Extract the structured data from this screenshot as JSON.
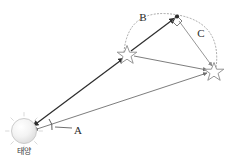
{
  "figure": {
    "background_color": "#ffffff",
    "width": 231,
    "height": 164
  },
  "sun": {
    "caption": "태양",
    "icon": "sun-icon",
    "center": {
      "x": 24,
      "y": 131
    },
    "radius": 12,
    "fill_color": "#efefef",
    "stroke_color": "#bdbdbd"
  },
  "stars": [
    {
      "name": "star-position-left",
      "icon": "star-icon",
      "x": 127,
      "y": 54,
      "size": 9,
      "stroke_color": "#8a8a8a"
    },
    {
      "name": "star-position-right",
      "icon": "star-icon",
      "x": 214,
      "y": 71,
      "size": 9,
      "stroke_color": "#8a8a8a"
    }
  ],
  "apex": {
    "name": "orbit-apex-point",
    "x": 178,
    "y": 17,
    "right_angle_marker": true
  },
  "labels": [
    {
      "name": "label-A",
      "text": "A",
      "x": 78,
      "y": 130,
      "angle_of": "sun-vertex-angle"
    },
    {
      "name": "label-B",
      "text": "B",
      "x": 143,
      "y": 17,
      "angle_of": "left-arc-segment"
    },
    {
      "name": "label-C",
      "text": "C",
      "x": 200,
      "y": 33,
      "angle_of": "right-arc-segment"
    }
  ],
  "lines": [
    {
      "name": "line-sun-to-left-star",
      "from": "sun",
      "to": "star-position-left",
      "color": "#2e2e2e",
      "width": 1.3,
      "arrow": "both"
    },
    {
      "name": "line-sun-to-right-star",
      "from": "sun",
      "to": "star-position-right",
      "color": "#6e6e6e",
      "width": 1.0,
      "arrow": "both"
    },
    {
      "name": "line-left-star-to-apex",
      "from": "star-position-left",
      "to": "apex",
      "color": "#2e2e2e",
      "width": 1.3,
      "arrow": "end"
    },
    {
      "name": "line-apex-to-right-star",
      "from": "apex",
      "to": "star-position-right",
      "color": "#8a8a8a",
      "width": 1.0,
      "arrow": "end"
    },
    {
      "name": "line-left-star-to-right-star",
      "from": "star-position-left",
      "to": "star-position-right",
      "color": "#6e6e6e",
      "width": 1.0,
      "arrow": "end"
    }
  ],
  "orbit_arc": {
    "name": "orbit-dotted-arc",
    "style": "dotted",
    "color": "#9a9a9a",
    "from": "star-position-left",
    "through": "apex",
    "to": "star-position-right"
  },
  "angle_arc_at_sun": {
    "name": "sun-angle-arc",
    "color": "#4a4a4a"
  }
}
